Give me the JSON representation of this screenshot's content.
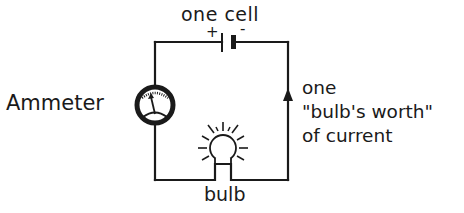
{
  "diagram": {
    "labels": {
      "cell": "one cell",
      "plus": "+",
      "minus": "-",
      "ammeter": "Ammeter",
      "current_line1": "one",
      "current_line2": "\"bulb's worth\"",
      "current_line3": "of current",
      "bulb": "bulb"
    },
    "components": [
      {
        "type": "cell",
        "name": "battery",
        "position": "top wire"
      },
      {
        "type": "ammeter",
        "name": "ammeter",
        "position": "left wire"
      },
      {
        "type": "bulb",
        "name": "light bulb",
        "position": "bottom wire",
        "state": "lit"
      },
      {
        "type": "current-arrow",
        "direction": "up",
        "position": "right wire"
      }
    ],
    "colors": {
      "ink": "#1a1a1a",
      "background": "#ffffff"
    }
  }
}
